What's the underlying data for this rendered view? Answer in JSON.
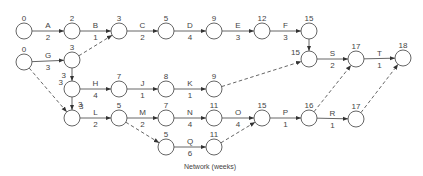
{
  "caption": "Network (weeks)",
  "colors": {
    "stroke": "#555555",
    "text": "#444444",
    "background": "#ffffff"
  },
  "nodes": [
    {
      "id": "n0a",
      "label": "0",
      "x": 24,
      "y": 31,
      "label_pos": "top"
    },
    {
      "id": "n2",
      "label": "2",
      "x": 72,
      "y": 31,
      "label_pos": "top"
    },
    {
      "id": "n3a",
      "label": "3",
      "x": 119,
      "y": 31,
      "label_pos": "top"
    },
    {
      "id": "n5a",
      "label": "5",
      "x": 166,
      "y": 31,
      "label_pos": "top"
    },
    {
      "id": "n9a",
      "label": "9",
      "x": 214,
      "y": 31,
      "label_pos": "top"
    },
    {
      "id": "n12",
      "label": "12",
      "x": 262,
      "y": 31,
      "label_pos": "top"
    },
    {
      "id": "n15a",
      "label": "15",
      "x": 309,
      "y": 31,
      "label_pos": "top"
    },
    {
      "id": "n0b",
      "label": "0",
      "x": 24,
      "y": 62,
      "label_pos": "top"
    },
    {
      "id": "n3b",
      "label": "3",
      "x": 72,
      "y": 60,
      "label_pos": "top"
    },
    {
      "id": "n15b",
      "label": "15",
      "x": 309,
      "y": 59,
      "label_pos": "left"
    },
    {
      "id": "n17a",
      "label": "17",
      "x": 356,
      "y": 59,
      "label_pos": "top"
    },
    {
      "id": "n18",
      "label": "18",
      "x": 403,
      "y": 58,
      "label_pos": "top"
    },
    {
      "id": "n3c",
      "label": "3",
      "x": 72,
      "y": 89,
      "label_pos": "left"
    },
    {
      "id": "n7a",
      "label": "7",
      "x": 119,
      "y": 89,
      "label_pos": "top"
    },
    {
      "id": "n8",
      "label": "8",
      "x": 166,
      "y": 89,
      "label_pos": "top"
    },
    {
      "id": "n9b",
      "label": "9",
      "x": 214,
      "y": 89,
      "label_pos": "top"
    },
    {
      "id": "n3d",
      "label": "3",
      "x": 72,
      "y": 118,
      "label_pos": "topright"
    },
    {
      "id": "n5b",
      "label": "5",
      "x": 119,
      "y": 118,
      "label_pos": "top"
    },
    {
      "id": "n7b",
      "label": "7",
      "x": 166,
      "y": 118,
      "label_pos": "top"
    },
    {
      "id": "n11a",
      "label": "11",
      "x": 214,
      "y": 118,
      "label_pos": "top"
    },
    {
      "id": "n15c",
      "label": "15",
      "x": 262,
      "y": 118,
      "label_pos": "top"
    },
    {
      "id": "n16",
      "label": "16",
      "x": 309,
      "y": 118,
      "label_pos": "top"
    },
    {
      "id": "n17b",
      "label": "17",
      "x": 356,
      "y": 119,
      "label_pos": "top"
    },
    {
      "id": "n5c",
      "label": "5",
      "x": 166,
      "y": 147,
      "label_pos": "top"
    },
    {
      "id": "n11b",
      "label": "11",
      "x": 214,
      "y": 147,
      "label_pos": "top"
    }
  ],
  "activities": [
    {
      "name": "A",
      "duration": "2",
      "from": "n0a",
      "to": "n2",
      "dashed": false
    },
    {
      "name": "B",
      "duration": "1",
      "from": "n2",
      "to": "n3a",
      "dashed": false
    },
    {
      "name": "C",
      "duration": "2",
      "from": "n3a",
      "to": "n5a",
      "dashed": false
    },
    {
      "name": "D",
      "duration": "4",
      "from": "n5a",
      "to": "n9a",
      "dashed": false
    },
    {
      "name": "E",
      "duration": "3",
      "from": "n9a",
      "to": "n12",
      "dashed": false
    },
    {
      "name": "F",
      "duration": "3",
      "from": "n12",
      "to": "n15a",
      "dashed": false
    },
    {
      "name": "G",
      "duration": "3",
      "from": "n0b",
      "to": "n3b",
      "dashed": false
    },
    {
      "name": "",
      "duration": "",
      "from": "n3b",
      "to": "n3a",
      "dashed": true
    },
    {
      "name": "",
      "duration": "3",
      "from": "n3b",
      "to": "n3c",
      "dashed": false,
      "dur_side": "left"
    },
    {
      "name": "H",
      "duration": "4",
      "from": "n3c",
      "to": "n7a",
      "dashed": false
    },
    {
      "name": "J",
      "duration": "1",
      "from": "n7a",
      "to": "n8",
      "dashed": false
    },
    {
      "name": "K",
      "duration": "1",
      "from": "n8",
      "to": "n9b",
      "dashed": false
    },
    {
      "name": "",
      "duration": "3",
      "from": "n3c",
      "to": "n3d",
      "dashed": false,
      "dur_side": "right"
    },
    {
      "name": "",
      "duration": "",
      "from": "n0b",
      "to": "n3d",
      "dashed": true
    },
    {
      "name": "L",
      "duration": "2",
      "from": "n3d",
      "to": "n5b",
      "dashed": false
    },
    {
      "name": "M",
      "duration": "2",
      "from": "n5b",
      "to": "n7b",
      "dashed": false
    },
    {
      "name": "N",
      "duration": "4",
      "from": "n7b",
      "to": "n11a",
      "dashed": false
    },
    {
      "name": "O",
      "duration": "4",
      "from": "n11a",
      "to": "n15c",
      "dashed": false
    },
    {
      "name": "P",
      "duration": "1",
      "from": "n15c",
      "to": "n16",
      "dashed": false
    },
    {
      "name": "R",
      "duration": "1",
      "from": "n16",
      "to": "n17b",
      "dashed": false
    },
    {
      "name": "",
      "duration": "",
      "from": "n5b",
      "to": "n5c",
      "dashed": true
    },
    {
      "name": "Q",
      "duration": "6",
      "from": "n5c",
      "to": "n11b",
      "dashed": false
    },
    {
      "name": "",
      "duration": "",
      "from": "n11b",
      "to": "n15c",
      "dashed": true
    },
    {
      "name": "",
      "duration": "",
      "from": "n15a",
      "to": "n15b",
      "dashed": false
    },
    {
      "name": "",
      "duration": "",
      "from": "n9b",
      "to": "n15b",
      "dashed": true
    },
    {
      "name": "S",
      "duration": "2",
      "from": "n15b",
      "to": "n17a",
      "dashed": false
    },
    {
      "name": "T",
      "duration": "1",
      "from": "n17a",
      "to": "n18",
      "dashed": false
    },
    {
      "name": "",
      "duration": "",
      "from": "n16",
      "to": "n17a",
      "dashed": true
    },
    {
      "name": "",
      "duration": "",
      "from": "n17b",
      "to": "n18",
      "dashed": true
    }
  ]
}
